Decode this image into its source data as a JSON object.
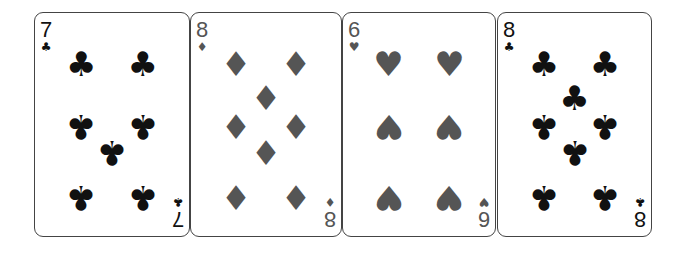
{
  "colors": {
    "black_suit": "#111111",
    "red_suit_rendered": "#555555",
    "card_border": "#444444"
  },
  "cards": [
    {
      "rank": "7",
      "suit": "clubs",
      "suit_glyph": "♣",
      "color": "#111111",
      "left": 34,
      "width": 156,
      "pips": [
        [
          30,
          23,
          0
        ],
        [
          70,
          23,
          0
        ],
        [
          30,
          51,
          1
        ],
        [
          70,
          51,
          1
        ],
        [
          50,
          63,
          1
        ],
        [
          30,
          83,
          1
        ],
        [
          70,
          83,
          1
        ]
      ]
    },
    {
      "rank": "8",
      "suit": "diamonds",
      "suit_glyph": "♦",
      "color": "#555555",
      "left": 190,
      "width": 152,
      "pips": [
        [
          30,
          23,
          0
        ],
        [
          70,
          23,
          0
        ],
        [
          50,
          38,
          0
        ],
        [
          30,
          51,
          0
        ],
        [
          70,
          51,
          0
        ],
        [
          50,
          63,
          0
        ],
        [
          30,
          83,
          0
        ],
        [
          70,
          83,
          0
        ]
      ]
    },
    {
      "rank": "6",
      "suit": "hearts",
      "suit_glyph": "♥",
      "color": "#555555",
      "left": 342,
      "width": 154,
      "pips": [
        [
          30,
          23,
          0
        ],
        [
          70,
          23,
          0
        ],
        [
          30,
          51,
          1
        ],
        [
          70,
          51,
          1
        ],
        [
          30,
          83,
          1
        ],
        [
          70,
          83,
          1
        ]
      ]
    },
    {
      "rank": "8",
      "suit": "clubs",
      "suit_glyph": "♣",
      "color": "#111111",
      "left": 497,
      "width": 155,
      "pips": [
        [
          30,
          23,
          0
        ],
        [
          70,
          23,
          0
        ],
        [
          50,
          38,
          0
        ],
        [
          30,
          51,
          1
        ],
        [
          70,
          51,
          1
        ],
        [
          50,
          63,
          1
        ],
        [
          30,
          83,
          1
        ],
        [
          70,
          83,
          1
        ]
      ]
    }
  ]
}
